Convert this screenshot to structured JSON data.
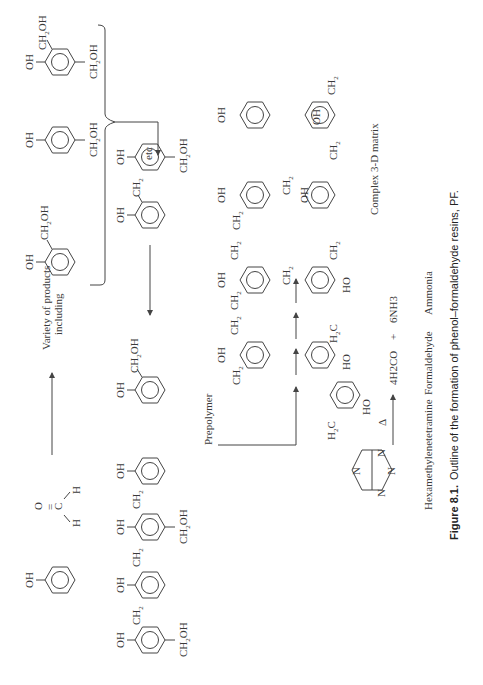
{
  "reactants": {
    "phenol": {
      "label": "OH"
    },
    "formaldehyde": {
      "o": "O",
      "c": "C",
      "h1": "H",
      "h2": "H"
    }
  },
  "products_label": {
    "line1": "Variety of products",
    "line2": "including"
  },
  "methylol_products": [
    {
      "substituents": [
        "OH",
        "CH2OH"
      ]
    },
    {
      "substituents": [
        "OH",
        "CH2OH"
      ]
    },
    {
      "substituents": [
        "OH",
        "CH2OH",
        "CH2OH"
      ]
    }
  ],
  "etc_label": "etc",
  "dimer": {
    "labels": [
      "OH",
      "CH2",
      "OH",
      "CH2OH"
    ]
  },
  "single_methylol": {
    "labels": [
      "OH",
      "CH2OH"
    ]
  },
  "prepolymer": {
    "label": "Prepolymer",
    "labels": [
      "OH",
      "CH2",
      "OH",
      "CH2",
      "OH",
      "CH2OH",
      "CH2OH"
    ]
  },
  "matrix": {
    "label": "Complex 3-D matrix",
    "group_labels": [
      "OH",
      "CH2",
      "HO",
      "H2C"
    ]
  },
  "hmta_equation": {
    "reactant": "Hexamethylenetetramine",
    "condition": "Δ",
    "product1": "4H2CO",
    "plus": "+",
    "product2": "6NH3",
    "product1_name": "Formaldehyde",
    "product2_name": "Ammonia",
    "atom": "N"
  },
  "caption": {
    "number": "Figure 8.1.",
    "text": "Outline of the formation of phenol–formaldehyde resins, PF."
  }
}
